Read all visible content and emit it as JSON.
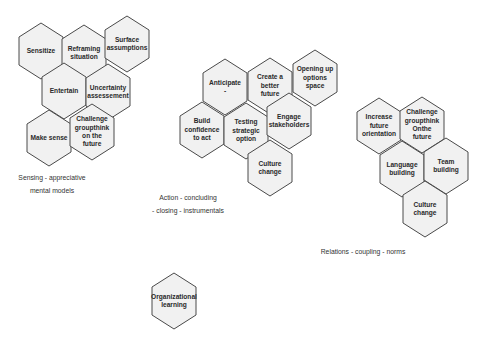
{
  "colors": {
    "hex_fill": "#f1f1f1",
    "hex_stroke": "#4a4a4a",
    "text": "#2a2a2a",
    "background": "#ffffff"
  },
  "clusters": [
    {
      "name": "sensing",
      "caption_lines": [
        "Sensing  -  appreciative",
        "mental  models"
      ],
      "caption_pos": [
        [
          52,
          173
        ],
        [
          52,
          186
        ]
      ],
      "hexes": [
        {
          "label": "Sensitize",
          "x": 19,
          "y": 23
        },
        {
          "label": "Reframing\nsituation",
          "x": 62,
          "y": 25
        },
        {
          "label": "Surface\nassumptions",
          "x": 105,
          "y": 16
        },
        {
          "label": "Entertain",
          "x": 42,
          "y": 63
        },
        {
          "label": "Uncertainty\nassessement",
          "x": 86,
          "y": 64
        },
        {
          "label": "Make sense",
          "x": 27,
          "y": 110
        },
        {
          "label": "Challenge\ngroupthink\non the\nfuture",
          "x": 70,
          "y": 104
        }
      ]
    },
    {
      "name": "action",
      "caption_lines": [
        "Action  -  concluding",
        "-  closing  -  instrumentals"
      ],
      "caption_pos": [
        [
          188,
          193
        ],
        [
          188,
          206
        ]
      ],
      "hexes": [
        {
          "label": "Anticipate\n-",
          "x": 203,
          "y": 59
        },
        {
          "label": "Create a\nbetter\nfuture",
          "x": 248,
          "y": 58
        },
        {
          "label": "Opening up\noptions\nspace",
          "x": 293,
          "y": 50
        },
        {
          "label": "Build\nconfidence\nto act",
          "x": 180,
          "y": 102
        },
        {
          "label": "Testing\nstrategic\noption",
          "x": 224,
          "y": 103
        },
        {
          "label": "Engage\nstakeholders",
          "x": 267,
          "y": 93
        },
        {
          "label": "Culture\nchange",
          "x": 248,
          "y": 140
        }
      ]
    },
    {
      "name": "relations",
      "caption_lines": [
        "Relations  -  coupling  -  norms"
      ],
      "caption_pos": [
        [
          363,
          247
        ]
      ],
      "hexes": [
        {
          "label": "Increase\nfuture\norientation",
          "x": 357,
          "y": 98
        },
        {
          "label": "Challenge\ngroupthink\nOnthe\nfuture",
          "x": 400,
          "y": 97
        },
        {
          "label": "Language\nbuilding",
          "x": 380,
          "y": 141
        },
        {
          "label": "Team\nbuilding",
          "x": 424,
          "y": 138
        },
        {
          "label": "Culture\nchange",
          "x": 403,
          "y": 181
        }
      ]
    },
    {
      "name": "learning",
      "caption_lines": [],
      "caption_pos": [],
      "hexes": [
        {
          "label": "Organizational\nlearning",
          "x": 152,
          "y": 273
        }
      ]
    }
  ],
  "hex_size": {
    "w": 44,
    "h": 56
  }
}
